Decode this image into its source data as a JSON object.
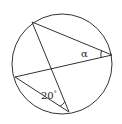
{
  "diagram": {
    "type": "inscribed-angles-circle",
    "circle": {
      "cx": 62,
      "cy": 64,
      "r": 50
    },
    "points": {
      "A": {
        "x": 32,
        "y": 22
      },
      "B": {
        "x": 112,
        "y": 55
      },
      "C": {
        "x": 15,
        "y": 77
      },
      "D": {
        "x": 69,
        "y": 112
      }
    },
    "chords": [
      [
        "A",
        "B"
      ],
      [
        "A",
        "D"
      ],
      [
        "C",
        "B"
      ],
      [
        "C",
        "D"
      ]
    ],
    "labels": {
      "alpha": "α",
      "given_angle": "20",
      "degree_mark": "°"
    },
    "stroke_color": "#333333"
  }
}
